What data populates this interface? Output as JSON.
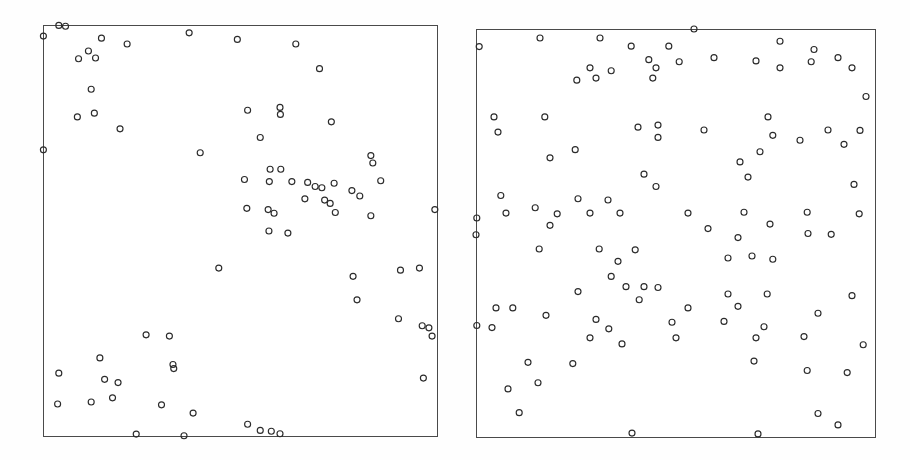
{
  "figure": {
    "width": 910,
    "height": 460,
    "background_color": "#fefefe",
    "panel_count": 2
  },
  "style": {
    "frame_color": "#4a4a4a",
    "frame_width_px": 1,
    "marker_shape": "open-circle",
    "marker_radius_px": 3.0,
    "marker_stroke_color": "#2b2b2b",
    "marker_stroke_width_px": 1.15,
    "panel_fill": "#ffffff"
  },
  "chart_data": [
    {
      "type": "scatter",
      "name": "left-panel",
      "title": "",
      "xlabel": "",
      "ylabel": "",
      "xlim": [
        0,
        1
      ],
      "ylim": [
        0,
        1
      ],
      "grid": false,
      "legend": "none",
      "axis_ticks": "none",
      "frame": {
        "x": 43,
        "y": 25,
        "width": 395,
        "height": 412
      },
      "n_points": 104,
      "pattern": "clustered",
      "points": [
        [
          0.04,
          0.999
        ],
        [
          0.057,
          0.997
        ],
        [
          0.001,
          0.973
        ],
        [
          0.148,
          0.968
        ],
        [
          0.213,
          0.954
        ],
        [
          0.37,
          0.981
        ],
        [
          0.492,
          0.965
        ],
        [
          0.64,
          0.954
        ],
        [
          0.115,
          0.937
        ],
        [
          0.133,
          0.92
        ],
        [
          0.09,
          0.918
        ],
        [
          0.7,
          0.894
        ],
        [
          0.122,
          0.844
        ],
        [
          0.13,
          0.786
        ],
        [
          0.087,
          0.777
        ],
        [
          0.195,
          0.748
        ],
        [
          0.518,
          0.793
        ],
        [
          0.6,
          0.8
        ],
        [
          0.601,
          0.783
        ],
        [
          0.73,
          0.765
        ],
        [
          0.001,
          0.697
        ],
        [
          0.55,
          0.727
        ],
        [
          0.398,
          0.69
        ],
        [
          0.83,
          0.683
        ],
        [
          0.835,
          0.665
        ],
        [
          0.575,
          0.65
        ],
        [
          0.602,
          0.65
        ],
        [
          0.51,
          0.625
        ],
        [
          0.855,
          0.622
        ],
        [
          0.573,
          0.62
        ],
        [
          0.63,
          0.62
        ],
        [
          0.67,
          0.618
        ],
        [
          0.689,
          0.608
        ],
        [
          0.706,
          0.605
        ],
        [
          0.737,
          0.616
        ],
        [
          0.782,
          0.598
        ],
        [
          0.802,
          0.585
        ],
        [
          0.663,
          0.578
        ],
        [
          0.713,
          0.575
        ],
        [
          0.727,
          0.567
        ],
        [
          0.516,
          0.555
        ],
        [
          0.57,
          0.552
        ],
        [
          0.585,
          0.543
        ],
        [
          0.74,
          0.545
        ],
        [
          0.83,
          0.537
        ],
        [
          0.992,
          0.552
        ],
        [
          0.572,
          0.5
        ],
        [
          0.62,
          0.495
        ],
        [
          0.445,
          0.41
        ],
        [
          0.785,
          0.39
        ],
        [
          0.905,
          0.405
        ],
        [
          0.953,
          0.41
        ],
        [
          0.795,
          0.333
        ],
        [
          0.9,
          0.287
        ],
        [
          0.96,
          0.27
        ],
        [
          0.977,
          0.265
        ],
        [
          0.985,
          0.245
        ],
        [
          0.261,
          0.248
        ],
        [
          0.32,
          0.245
        ],
        [
          0.144,
          0.192
        ],
        [
          0.329,
          0.176
        ],
        [
          0.331,
          0.166
        ],
        [
          0.04,
          0.155
        ],
        [
          0.156,
          0.14
        ],
        [
          0.19,
          0.132
        ],
        [
          0.963,
          0.143
        ],
        [
          0.176,
          0.095
        ],
        [
          0.122,
          0.085
        ],
        [
          0.037,
          0.08
        ],
        [
          0.3,
          0.078
        ],
        [
          0.38,
          0.058
        ],
        [
          0.518,
          0.031
        ],
        [
          0.55,
          0.016
        ],
        [
          0.578,
          0.014
        ],
        [
          0.6,
          0.008
        ],
        [
          0.236,
          0.007
        ],
        [
          0.357,
          0.003
        ]
      ]
    },
    {
      "type": "scatter",
      "name": "right-panel",
      "title": "",
      "xlabel": "",
      "ylabel": "",
      "xlim": [
        0,
        1
      ],
      "ylim": [
        0,
        1
      ],
      "grid": false,
      "legend": "none",
      "axis_ticks": "none",
      "frame": {
        "x": 476,
        "y": 29,
        "width": 400,
        "height": 409
      },
      "n_points": 110,
      "pattern": "regular-uniform",
      "points": [
        [
          0.545,
          1.0
        ],
        [
          0.16,
          0.978
        ],
        [
          0.31,
          0.978
        ],
        [
          0.008,
          0.957
        ],
        [
          0.388,
          0.958
        ],
        [
          0.76,
          0.97
        ],
        [
          0.482,
          0.958
        ],
        [
          0.845,
          0.95
        ],
        [
          0.905,
          0.93
        ],
        [
          0.432,
          0.925
        ],
        [
          0.508,
          0.92
        ],
        [
          0.595,
          0.93
        ],
        [
          0.7,
          0.922
        ],
        [
          0.838,
          0.92
        ],
        [
          0.285,
          0.905
        ],
        [
          0.45,
          0.905
        ],
        [
          0.76,
          0.905
        ],
        [
          0.94,
          0.905
        ],
        [
          0.338,
          0.898
        ],
        [
          0.3,
          0.88
        ],
        [
          0.252,
          0.875
        ],
        [
          0.442,
          0.88
        ],
        [
          0.975,
          0.835
        ],
        [
          0.045,
          0.785
        ],
        [
          0.172,
          0.785
        ],
        [
          0.73,
          0.785
        ],
        [
          0.405,
          0.76
        ],
        [
          0.455,
          0.765
        ],
        [
          0.055,
          0.748
        ],
        [
          0.57,
          0.753
        ],
        [
          0.88,
          0.753
        ],
        [
          0.96,
          0.752
        ],
        [
          0.455,
          0.735
        ],
        [
          0.742,
          0.74
        ],
        [
          0.81,
          0.728
        ],
        [
          0.92,
          0.718
        ],
        [
          0.248,
          0.705
        ],
        [
          0.71,
          0.7
        ],
        [
          0.185,
          0.685
        ],
        [
          0.66,
          0.675
        ],
        [
          0.42,
          0.645
        ],
        [
          0.68,
          0.638
        ],
        [
          0.45,
          0.615
        ],
        [
          0.945,
          0.62
        ],
        [
          0.062,
          0.593
        ],
        [
          0.255,
          0.585
        ],
        [
          0.33,
          0.582
        ],
        [
          0.148,
          0.563
        ],
        [
          0.075,
          0.55
        ],
        [
          0.285,
          0.55
        ],
        [
          0.203,
          0.548
        ],
        [
          0.36,
          0.55
        ],
        [
          0.53,
          0.55
        ],
        [
          0.828,
          0.552
        ],
        [
          0.958,
          0.548
        ],
        [
          0.002,
          0.538
        ],
        [
          0.67,
          0.552
        ],
        [
          0.185,
          0.52
        ],
        [
          0.735,
          0.523
        ],
        [
          0.58,
          0.512
        ],
        [
          0.0,
          0.497
        ],
        [
          0.83,
          0.5
        ],
        [
          0.888,
          0.498
        ],
        [
          0.655,
          0.49
        ],
        [
          0.158,
          0.462
        ],
        [
          0.308,
          0.462
        ],
        [
          0.398,
          0.46
        ],
        [
          0.63,
          0.44
        ],
        [
          0.69,
          0.445
        ],
        [
          0.355,
          0.432
        ],
        [
          0.742,
          0.437
        ],
        [
          0.338,
          0.395
        ],
        [
          0.375,
          0.37
        ],
        [
          0.42,
          0.37
        ],
        [
          0.455,
          0.368
        ],
        [
          0.255,
          0.358
        ],
        [
          0.63,
          0.352
        ],
        [
          0.728,
          0.352
        ],
        [
          0.94,
          0.348
        ],
        [
          0.408,
          0.338
        ],
        [
          0.05,
          0.318
        ],
        [
          0.092,
          0.318
        ],
        [
          0.655,
          0.322
        ],
        [
          0.53,
          0.318
        ],
        [
          0.855,
          0.305
        ],
        [
          0.175,
          0.3
        ],
        [
          0.3,
          0.29
        ],
        [
          0.49,
          0.283
        ],
        [
          0.62,
          0.285
        ],
        [
          0.002,
          0.275
        ],
        [
          0.04,
          0.27
        ],
        [
          0.332,
          0.267
        ],
        [
          0.72,
          0.272
        ],
        [
          0.285,
          0.245
        ],
        [
          0.5,
          0.245
        ],
        [
          0.7,
          0.245
        ],
        [
          0.82,
          0.248
        ],
        [
          0.365,
          0.23
        ],
        [
          0.968,
          0.228
        ],
        [
          0.13,
          0.185
        ],
        [
          0.242,
          0.182
        ],
        [
          0.695,
          0.188
        ],
        [
          0.828,
          0.165
        ],
        [
          0.928,
          0.16
        ],
        [
          0.155,
          0.135
        ],
        [
          0.08,
          0.12
        ],
        [
          0.108,
          0.062
        ],
        [
          0.855,
          0.06
        ],
        [
          0.905,
          0.032
        ],
        [
          0.39,
          0.012
        ],
        [
          0.705,
          0.01
        ]
      ]
    }
  ]
}
